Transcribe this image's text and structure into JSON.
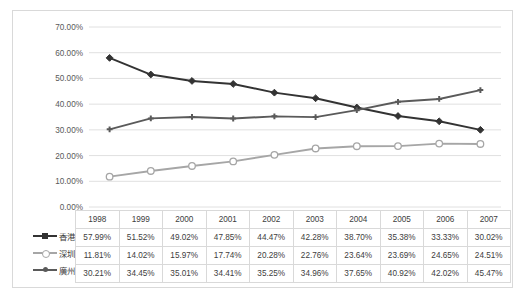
{
  "cut_title_fragment": "",
  "chart_data": {
    "type": "line",
    "title": "",
    "xlabel": "",
    "ylabel": "",
    "ylim": [
      0,
      70
    ],
    "ytick_labels": [
      "70.00%",
      "60.00%",
      "50.00%",
      "40.00%",
      "30.00%",
      "20.00%",
      "10.00%",
      "0.00%"
    ],
    "ytick_values": [
      70,
      60,
      50,
      40,
      30,
      20,
      10,
      0
    ],
    "grid": true,
    "legend_position": "data-table-left",
    "categories": [
      "1998",
      "1999",
      "2000",
      "2001",
      "2002",
      "2003",
      "2004",
      "2005",
      "2006",
      "2007"
    ],
    "series": [
      {
        "name": "香港",
        "color": "#333333",
        "marker": "filled-diamond",
        "values": [
          57.99,
          51.52,
          49.02,
          47.85,
          44.47,
          42.28,
          38.7,
          35.38,
          33.33,
          30.02
        ],
        "labels": [
          "57.99%",
          "51.52%",
          "49.02%",
          "47.85%",
          "44.47%",
          "42.28%",
          "38.70%",
          "35.38%",
          "33.33%",
          "30.02%"
        ]
      },
      {
        "name": "深圳",
        "color": "#a6a6a6",
        "marker": "hollow-circle",
        "values": [
          11.81,
          14.02,
          15.97,
          17.74,
          20.28,
          22.76,
          23.64,
          23.69,
          24.65,
          24.51
        ],
        "labels": [
          "11.81%",
          "14.02%",
          "15.97%",
          "17.74%",
          "20.28%",
          "22.76%",
          "23.64%",
          "23.69%",
          "24.65%",
          "24.51%"
        ]
      },
      {
        "name": "廣州",
        "color": "#5a5a5a",
        "marker": "cross-star",
        "values": [
          30.21,
          34.45,
          35.01,
          34.41,
          35.25,
          34.96,
          37.65,
          40.92,
          42.02,
          45.47
        ],
        "labels": [
          "30.21%",
          "34.45%",
          "35.01%",
          "34.41%",
          "35.25%",
          "34.96%",
          "37.65%",
          "40.92%",
          "42.02%",
          "45.47%"
        ]
      }
    ]
  },
  "table": {
    "corner_label": "",
    "header": [
      "1998",
      "1999",
      "2000",
      "2001",
      "2002",
      "2003",
      "2004",
      "2005",
      "2006",
      "2007"
    ],
    "rows": [
      {
        "label": "香港",
        "cells": [
          "57.99%",
          "51.52%",
          "49.02%",
          "47.85%",
          "44.47%",
          "42.28%",
          "38.70%",
          "35.38%",
          "33.33%",
          "30.02%"
        ]
      },
      {
        "label": "深圳",
        "cells": [
          "11.81%",
          "14.02%",
          "15.97%",
          "17.74%",
          "20.28%",
          "22.76%",
          "23.64%",
          "23.69%",
          "24.65%",
          "24.51%"
        ]
      },
      {
        "label": "廣州",
        "cells": [
          "30.21%",
          "34.45%",
          "35.01%",
          "34.41%",
          "35.25%",
          "34.96%",
          "37.65%",
          "40.92%",
          "42.02%",
          "45.47%"
        ]
      }
    ]
  },
  "colors": {
    "frame_border": "#d9d9d9",
    "grid": "#e0e0e0",
    "text": "#404040",
    "axis_text": "#595959"
  }
}
